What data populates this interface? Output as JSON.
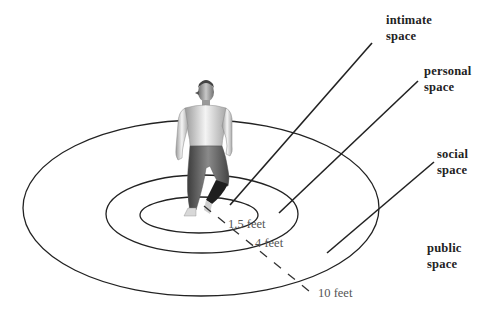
{
  "diagram": {
    "zones": [
      {
        "id": "intimate",
        "line1": "intimate",
        "line2": "space"
      },
      {
        "id": "personal",
        "line1": "personal",
        "line2": "space"
      },
      {
        "id": "social",
        "line1": "social",
        "line2": "space"
      },
      {
        "id": "public",
        "line1": "public",
        "line2": "space"
      }
    ],
    "distances": [
      {
        "id": "d1",
        "label": "1.5 feet"
      },
      {
        "id": "d2",
        "label": "4 feet"
      },
      {
        "id": "d3",
        "label": "10 feet"
      }
    ],
    "figure": "standing-human-figure",
    "colors": {
      "line": "#222222",
      "dashed": "#333333",
      "text": "#222222",
      "distance_text": "#555555",
      "background": "#ffffff"
    }
  }
}
